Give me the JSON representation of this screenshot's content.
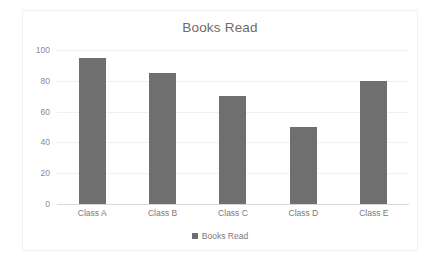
{
  "chart_data": {
    "type": "bar",
    "title": "Books Read",
    "categories": [
      "Class A",
      "Class B",
      "Class C",
      "Class D",
      "Class E"
    ],
    "values": [
      95,
      85,
      70,
      50,
      80
    ],
    "series": [
      {
        "name": "Books Read",
        "values": [
          95,
          85,
          70,
          50,
          80
        ]
      }
    ],
    "xlabel": "",
    "ylabel": "",
    "ylim": [
      0,
      100
    ],
    "y_ticks": [
      0,
      20,
      40,
      60,
      80,
      100
    ],
    "y_tick_labels": [
      "0",
      "20",
      "40",
      "60",
      "80",
      "100"
    ],
    "grid": true,
    "legend": {
      "position": "bottom",
      "entries": [
        {
          "label": "Books Read",
          "color": "#6f6f6f",
          "marker": "square-swatch"
        }
      ]
    },
    "colors": {
      "bar": "#6f6f6f",
      "gridline": "#f0f0f0",
      "axis": "#d9d9d9",
      "title_text": "#6b6b6b",
      "tick_text": "#8c8c8c",
      "plot_background": "#ffffff"
    }
  }
}
